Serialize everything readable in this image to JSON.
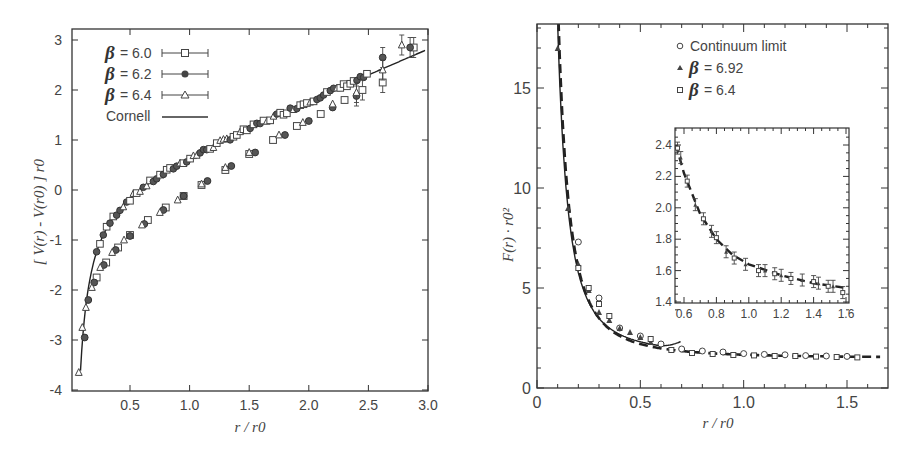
{
  "chart_data": [
    {
      "type": "scatter",
      "title": "",
      "xlabel": "r / r_0",
      "ylabel": "[ V(r) - V(r_0) ] r_0",
      "xlim": [
        0.05,
        3.0
      ],
      "ylim": [
        -4,
        3.2
      ],
      "grid": false,
      "legend_position": "upper left",
      "xticks": [
        "0.5",
        "1.0",
        "1.5",
        "2.0",
        "2.5",
        "3.0"
      ],
      "yticks": [
        "-4",
        "-3",
        "-2",
        "-1",
        "0",
        "1",
        "2",
        "3"
      ],
      "legend": [
        {
          "label": "β = 6.0",
          "marker": "open-square",
          "style": "errorbar"
        },
        {
          "label": "β = 6.2",
          "marker": "filled-circle",
          "style": "errorbar"
        },
        {
          "label": "β = 6.4",
          "marker": "open-triangle",
          "style": "errorbar"
        },
        {
          "label": "Cornell",
          "marker": "none",
          "style": "solid-line"
        }
      ],
      "series": [
        {
          "name": "β = 6.0",
          "x": [
            0.22,
            0.3,
            0.4,
            0.5,
            0.65,
            0.8,
            0.95,
            1.1,
            1.3,
            1.5,
            1.7,
            1.9,
            2.1,
            2.3,
            2.45,
            2.62,
            2.88
          ],
          "y": [
            -1.75,
            -1.45,
            -1.15,
            -0.9,
            -0.6,
            -0.35,
            -0.12,
            0.1,
            0.4,
            0.72,
            1.0,
            1.28,
            1.52,
            1.8,
            2.0,
            2.15,
            2.85
          ]
        },
        {
          "name": "β = 6.2",
          "x": [
            0.12,
            0.15,
            0.2,
            0.28,
            0.38,
            0.5,
            0.62,
            0.78,
            0.95,
            1.15,
            1.35,
            1.55,
            1.8,
            2.0,
            2.2,
            2.4,
            2.62,
            2.85
          ],
          "y": [
            -2.95,
            -2.2,
            -1.85,
            -1.5,
            -1.2,
            -0.92,
            -0.68,
            -0.4,
            -0.12,
            0.18,
            0.48,
            0.75,
            1.1,
            1.38,
            1.65,
            1.88,
            2.65,
            2.85
          ]
        },
        {
          "name": "β = 6.4",
          "x": [
            0.07,
            0.1,
            0.13,
            0.18,
            0.25,
            0.35,
            0.45,
            0.6,
            0.75,
            0.9,
            1.1,
            1.3,
            1.5,
            1.75,
            1.95,
            2.2,
            2.4,
            2.62,
            2.78
          ],
          "y": [
            -3.65,
            -2.75,
            -2.35,
            -1.95,
            -1.55,
            -1.25,
            -1.0,
            -0.7,
            -0.45,
            -0.2,
            0.12,
            0.45,
            0.75,
            1.1,
            1.35,
            1.72,
            1.95,
            2.4,
            2.9
          ]
        },
        {
          "name": "Cornell",
          "type": "line",
          "x": [
            0.08,
            0.1,
            0.15,
            0.2,
            0.3,
            0.4,
            0.5,
            0.7,
            1.0,
            1.5,
            2.0,
            2.5,
            3.0
          ],
          "y": [
            -4.0,
            -3.25,
            -2.35,
            -1.9,
            -1.4,
            -1.12,
            -0.9,
            -0.55,
            -0.1,
            0.6,
            1.3,
            2.05,
            2.85
          ]
        }
      ]
    },
    {
      "type": "scatter",
      "title": "",
      "xlabel": "r / r_0",
      "ylabel": "F(r) · r_0^2",
      "xlim": [
        0,
        1.7
      ],
      "ylim": [
        0,
        18
      ],
      "grid": false,
      "legend_position": "upper right",
      "xticks": [
        "0",
        "0.5",
        "1.0",
        "1.5"
      ],
      "yticks": [
        "0",
        "5",
        "10",
        "15"
      ],
      "legend": [
        {
          "label": "Continuum limit",
          "marker": "open-circle"
        },
        {
          "label": "β = 6.92",
          "marker": "filled-triangle"
        },
        {
          "label": "β = 6.4",
          "marker": "open-square"
        }
      ],
      "series": [
        {
          "name": "Continuum limit",
          "x": [
            0.2,
            0.3,
            0.4,
            0.5,
            0.6,
            0.7,
            0.8,
            0.9,
            1.0,
            1.1,
            1.2,
            1.3,
            1.4,
            1.5
          ],
          "y": [
            7.3,
            4.5,
            3.0,
            2.6,
            2.2,
            1.95,
            1.85,
            1.8,
            1.72,
            1.68,
            1.66,
            1.62,
            1.6,
            1.58
          ]
        },
        {
          "name": "β = 6.92",
          "x": [
            0.1,
            0.15,
            0.2,
            0.25,
            0.3,
            0.35,
            0.4,
            0.45,
            0.5,
            0.55
          ],
          "y": [
            17.0,
            9.0,
            6.2,
            4.9,
            3.8,
            3.4,
            3.0,
            2.8,
            2.55,
            2.3
          ]
        },
        {
          "name": "β = 6.4",
          "x": [
            0.2,
            0.25,
            0.3,
            0.35,
            0.55,
            0.65,
            0.75,
            0.85,
            0.95,
            1.05,
            1.15,
            1.25,
            1.35,
            1.45,
            1.55
          ],
          "y": [
            6.0,
            5.0,
            4.2,
            3.6,
            2.3,
            1.75,
            1.6,
            1.55,
            1.5,
            1.48,
            1.45,
            1.45,
            1.42,
            1.4,
            1.38
          ]
        },
        {
          "name": "Cornell (solid)",
          "type": "line",
          "x": [
            0.1,
            0.15,
            0.2,
            0.3,
            0.4,
            0.5,
            0.6,
            0.7
          ],
          "y": [
            18,
            10.5,
            6.5,
            3.8,
            2.8,
            2.3,
            2.05,
            2.4
          ]
        },
        {
          "name": "Fit (dashed)",
          "type": "line",
          "x": [
            0.1,
            0.15,
            0.2,
            0.3,
            0.5,
            0.7,
            1.0,
            1.3,
            1.6
          ],
          "y": [
            18,
            11.5,
            7.2,
            4.3,
            2.5,
            2.0,
            1.75,
            1.65,
            1.6
          ]
        }
      ],
      "inset": {
        "xlim": [
          0.55,
          1.62
        ],
        "ylim": [
          1.35,
          2.48
        ],
        "xticks": [
          "0.6",
          "0.8",
          "1.0",
          "1.2",
          "1.4",
          "1.6"
        ],
        "yticks": [
          "1.4",
          "1.6",
          "1.8",
          "2.0",
          "2.2",
          "2.4"
        ],
        "points": {
          "x": [
            0.56,
            0.58,
            0.62,
            0.67,
            0.72,
            0.77,
            0.8,
            0.86,
            0.91,
            0.98,
            1.06,
            1.1,
            1.16,
            1.2,
            1.26,
            1.33,
            1.4,
            1.43,
            1.49,
            1.52,
            1.58
          ],
          "y": [
            2.38,
            2.32,
            2.17,
            2.02,
            1.93,
            1.85,
            1.81,
            1.72,
            1.68,
            1.64,
            1.6,
            1.6,
            1.58,
            1.57,
            1.55,
            1.54,
            1.53,
            1.52,
            1.5,
            1.5,
            1.46
          ]
        },
        "fit_line": {
          "x": [
            0.55,
            0.6,
            0.7,
            0.8,
            0.9,
            1.0,
            1.2,
            1.4,
            1.6
          ],
          "y": [
            2.4,
            2.22,
            1.96,
            1.8,
            1.7,
            1.64,
            1.57,
            1.52,
            1.49
          ]
        }
      }
    }
  ],
  "left_chart": {
    "ylabel": "[ V(r) - V(r0) ] r0",
    "xlabel": "r / r0",
    "legend": {
      "b60": "= 6.0",
      "b62": "= 6.2",
      "b64": "= 6.4",
      "beta": "β",
      "cornell": "Cornell"
    }
  },
  "right_chart": {
    "ylabel": "F(r) · r0²",
    "xlabel": "r / r0",
    "legend": {
      "continuum": "Continuum limit",
      "b692": "= 6.92",
      "b64": "= 6.4",
      "beta": "β"
    }
  }
}
